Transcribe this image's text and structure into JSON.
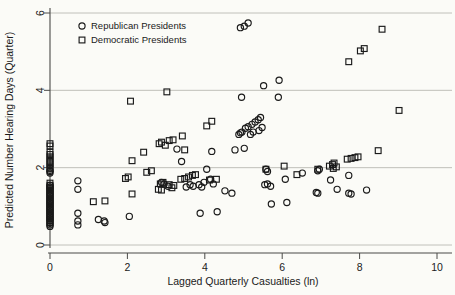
{
  "chart_data": {
    "type": "scatter",
    "title": "",
    "xlabel": "Lagged Quarterly Casualties (ln)",
    "ylabel": "Predicted Number Hearing Days (Quarter)",
    "xlim": [
      -0.25,
      10.3
    ],
    "ylim": [
      -0.15,
      6.25
    ],
    "xticks": [
      0,
      2,
      4,
      6,
      8,
      10
    ],
    "yticks": [
      0,
      2,
      4,
      6
    ],
    "xticklabels": [
      "0",
      "2",
      "4",
      "6",
      "8",
      "10"
    ],
    "yticklabels": [
      "0",
      "2",
      "4",
      "6"
    ],
    "grid": "horizontal",
    "gridlines_y": [
      0,
      2,
      4,
      6
    ],
    "legend_position": "upper-left-inside",
    "marker_color": "#1a1a1a",
    "background_color": "#fbfbf7",
    "series": [
      {
        "name": "Republican Presidents",
        "marker": "circle",
        "points": [
          [
            0.0,
            1.93
          ],
          [
            0.0,
            1.9
          ],
          [
            0.0,
            1.86
          ],
          [
            0.0,
            1.55
          ],
          [
            0.0,
            1.5
          ],
          [
            0.0,
            1.46
          ],
          [
            0.0,
            1.4
          ],
          [
            0.0,
            1.34
          ],
          [
            0.0,
            1.28
          ],
          [
            0.0,
            1.22
          ],
          [
            0.0,
            1.16
          ],
          [
            0.0,
            1.1
          ],
          [
            0.0,
            1.04
          ],
          [
            0.0,
            0.98
          ],
          [
            0.0,
            0.92
          ],
          [
            0.0,
            0.86
          ],
          [
            0.0,
            0.8
          ],
          [
            0.0,
            0.74
          ],
          [
            0.0,
            0.68
          ],
          [
            0.0,
            0.62
          ],
          [
            0.0,
            0.56
          ],
          [
            0.0,
            0.52
          ],
          [
            0.0,
            0.48
          ],
          [
            0.72,
            1.66
          ],
          [
            0.72,
            1.44
          ],
          [
            0.72,
            0.82
          ],
          [
            0.72,
            0.62
          ],
          [
            0.72,
            0.52
          ],
          [
            1.25,
            0.66
          ],
          [
            1.4,
            0.62
          ],
          [
            1.42,
            0.58
          ],
          [
            2.05,
            0.74
          ],
          [
            2.88,
            1.62
          ],
          [
            2.95,
            1.58
          ],
          [
            3.05,
            1.52
          ],
          [
            3.28,
            2.48
          ],
          [
            3.4,
            2.16
          ],
          [
            3.52,
            1.5
          ],
          [
            3.62,
            1.56
          ],
          [
            3.7,
            1.52
          ],
          [
            3.85,
            1.56
          ],
          [
            3.92,
            1.5
          ],
          [
            3.98,
            1.62
          ],
          [
            4.05,
            1.96
          ],
          [
            3.88,
            0.82
          ],
          [
            4.15,
            1.7
          ],
          [
            4.22,
            1.58
          ],
          [
            4.32,
            0.86
          ],
          [
            4.18,
            2.42
          ],
          [
            4.52,
            1.4
          ],
          [
            4.7,
            1.34
          ],
          [
            4.78,
            2.46
          ],
          [
            4.92,
            5.62
          ],
          [
            5.02,
            5.66
          ],
          [
            5.12,
            5.74
          ],
          [
            4.88,
            2.86
          ],
          [
            4.92,
            2.9
          ],
          [
            4.96,
            2.92
          ],
          [
            5.05,
            3.02
          ],
          [
            5.12,
            3.06
          ],
          [
            5.22,
            3.12
          ],
          [
            5.18,
            2.86
          ],
          [
            5.25,
            2.92
          ],
          [
            5.3,
            3.18
          ],
          [
            5.38,
            3.24
          ],
          [
            5.44,
            3.3
          ],
          [
            5.4,
            2.96
          ],
          [
            5.48,
            3.04
          ],
          [
            5.02,
            2.5
          ],
          [
            4.95,
            3.82
          ],
          [
            5.52,
            4.12
          ],
          [
            5.92,
            4.26
          ],
          [
            5.9,
            3.82
          ],
          [
            5.58,
            1.96
          ],
          [
            5.62,
            1.9
          ],
          [
            5.55,
            1.56
          ],
          [
            5.62,
            1.58
          ],
          [
            5.7,
            1.52
          ],
          [
            5.72,
            1.06
          ],
          [
            6.12,
            1.1
          ],
          [
            6.08,
            1.7
          ],
          [
            6.52,
            1.86
          ],
          [
            6.92,
            1.92
          ],
          [
            6.96,
            1.96
          ],
          [
            6.88,
            1.36
          ],
          [
            6.92,
            1.34
          ],
          [
            7.25,
            1.68
          ],
          [
            7.42,
            1.44
          ],
          [
            7.72,
            1.8
          ],
          [
            7.72,
            1.34
          ],
          [
            7.78,
            1.32
          ],
          [
            8.18,
            1.42
          ]
        ]
      },
      {
        "name": "Democratic Presidents",
        "marker": "square",
        "points": [
          [
            0.0,
            2.62
          ],
          [
            0.0,
            2.56
          ],
          [
            0.0,
            2.4
          ],
          [
            0.0,
            2.34
          ],
          [
            0.0,
            2.28
          ],
          [
            0.0,
            2.22
          ],
          [
            0.0,
            2.16
          ],
          [
            0.0,
            2.1
          ],
          [
            0.0,
            2.04
          ],
          [
            0.0,
            1.98
          ],
          [
            0.0,
            1.6
          ],
          [
            0.0,
            1.54
          ],
          [
            0.0,
            1.48
          ],
          [
            0.0,
            1.42
          ],
          [
            0.0,
            1.36
          ],
          [
            0.0,
            1.3
          ],
          [
            0.0,
            1.24
          ],
          [
            0.0,
            1.18
          ],
          [
            0.0,
            1.12
          ],
          [
            0.0,
            1.06
          ],
          [
            0.0,
            1.0
          ],
          [
            0.0,
            0.94
          ],
          [
            0.0,
            0.88
          ],
          [
            0.0,
            0.82
          ],
          [
            0.0,
            0.76
          ],
          [
            0.0,
            0.7
          ],
          [
            0.0,
            0.64
          ],
          [
            0.0,
            0.58
          ],
          [
            1.12,
            1.12
          ],
          [
            1.42,
            1.14
          ],
          [
            1.95,
            1.72
          ],
          [
            2.02,
            1.76
          ],
          [
            2.08,
            3.72
          ],
          [
            2.12,
            2.18
          ],
          [
            2.12,
            1.32
          ],
          [
            2.42,
            2.4
          ],
          [
            2.5,
            1.88
          ],
          [
            2.62,
            1.92
          ],
          [
            2.82,
            2.62
          ],
          [
            2.88,
            2.66
          ],
          [
            2.98,
            2.58
          ],
          [
            2.85,
            1.58
          ],
          [
            2.92,
            1.62
          ],
          [
            2.8,
            1.44
          ],
          [
            2.88,
            1.42
          ],
          [
            3.02,
            3.96
          ],
          [
            3.08,
            2.7
          ],
          [
            3.18,
            2.72
          ],
          [
            3.08,
            1.56
          ],
          [
            3.15,
            1.48
          ],
          [
            3.2,
            1.54
          ],
          [
            3.42,
            2.82
          ],
          [
            3.48,
            2.46
          ],
          [
            3.38,
            1.7
          ],
          [
            3.48,
            1.72
          ],
          [
            3.58,
            1.76
          ],
          [
            3.68,
            1.8
          ],
          [
            3.76,
            1.82
          ],
          [
            4.05,
            3.08
          ],
          [
            4.18,
            3.2
          ],
          [
            4.12,
            1.68
          ],
          [
            4.3,
            1.7
          ],
          [
            5.58,
            1.96
          ],
          [
            6.05,
            2.04
          ],
          [
            6.38,
            1.82
          ],
          [
            6.92,
            1.96
          ],
          [
            7.22,
            2.04
          ],
          [
            7.3,
            2.08
          ],
          [
            7.34,
            2.12
          ],
          [
            7.32,
            1.98
          ],
          [
            7.4,
            2.02
          ],
          [
            7.68,
            2.22
          ],
          [
            7.78,
            2.24
          ],
          [
            7.88,
            2.26
          ],
          [
            7.96,
            2.28
          ],
          [
            7.72,
            4.74
          ],
          [
            8.02,
            5.02
          ],
          [
            8.12,
            5.08
          ],
          [
            8.58,
            5.58
          ],
          [
            8.48,
            2.44
          ],
          [
            9.02,
            3.48
          ]
        ]
      }
    ]
  },
  "legend": {
    "entries": [
      {
        "label": "Republican Presidents",
        "marker": "circle"
      },
      {
        "label": "Democratic Presidents",
        "marker": "square"
      }
    ]
  }
}
